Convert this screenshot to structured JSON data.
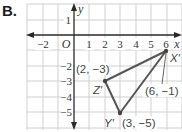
{
  "part_label": "B.",
  "axes": {
    "x_name": "x",
    "y_name": "y",
    "origin": "O",
    "x_ticks": [
      "−2",
      "1",
      "2",
      "3",
      "4",
      "5",
      "6"
    ],
    "y_ticks": [
      "1",
      "−2",
      "−3",
      "−4",
      "−5"
    ]
  },
  "grid": {
    "x_range": [
      -3,
      7
    ],
    "y_range": [
      -6,
      2
    ]
  },
  "triangle": {
    "vertices": [
      {
        "name": "X′",
        "coord_label": "(6, −1)",
        "x": 6,
        "y": -1
      },
      {
        "name": "Y′",
        "coord_label": "(3, −5)",
        "x": 3,
        "y": -5
      },
      {
        "name": "Z′",
        "coord_label": "(2, −3)",
        "x": 2,
        "y": -3
      }
    ]
  },
  "colors": {
    "grid": "#cfcfcf",
    "axis": "#2a2a2a",
    "triangle": "#555555"
  }
}
